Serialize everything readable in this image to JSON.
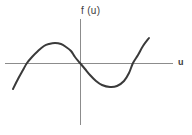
{
  "figure": {
    "title": "",
    "background_color": "#ffffff",
    "axis_color": "#8c8c8c",
    "curve_color": "#3a3a3a"
  },
  "labels": {
    "y_axis": "f (u)",
    "x_axis": "u"
  },
  "chart_data": {
    "type": "line",
    "title": "",
    "xlabel": "u",
    "ylabel": "f (u)",
    "grid": false,
    "legend": null,
    "axes": {
      "x_axis_y_pixel": 63,
      "y_axis_x_pixel": 80,
      "x_axis_range_pixels": [
        5,
        173
      ],
      "y_axis_range_pixels": [
        19,
        125
      ],
      "origin_pixel": [
        80,
        63
      ]
    },
    "annotations": [
      {
        "label": "local maximum",
        "x": 55,
        "y": 43
      },
      {
        "label": "origin crossing",
        "x": 80,
        "y": 63
      },
      {
        "label": "local minimum",
        "x": 110,
        "y": 87
      }
    ],
    "zero_crossings_x_pixels": [
      27,
      80,
      133
    ],
    "x": [
      13,
      18,
      23,
      27,
      32,
      38,
      44,
      49,
      55,
      61,
      66,
      71,
      75,
      80,
      85,
      90,
      96,
      102,
      110,
      117,
      124,
      129,
      133,
      138,
      143,
      149
    ],
    "y": [
      89,
      79,
      70,
      63,
      57,
      51,
      46,
      44,
      43,
      44,
      47,
      51,
      57,
      63,
      69,
      75,
      81,
      85,
      87,
      86,
      81,
      73,
      63,
      55,
      46,
      38
    ],
    "series": [
      {
        "name": "f (u)",
        "points": [
          [
            13,
            89
          ],
          [
            18,
            79
          ],
          [
            23,
            70
          ],
          [
            27,
            63
          ],
          [
            32,
            57
          ],
          [
            38,
            51
          ],
          [
            44,
            46
          ],
          [
            49,
            44
          ],
          [
            55,
            43
          ],
          [
            61,
            44
          ],
          [
            66,
            47
          ],
          [
            71,
            51
          ],
          [
            75,
            57
          ],
          [
            80,
            63
          ],
          [
            85,
            69
          ],
          [
            90,
            75
          ],
          [
            96,
            81
          ],
          [
            102,
            85
          ],
          [
            110,
            87
          ],
          [
            117,
            86
          ],
          [
            124,
            81
          ],
          [
            129,
            73
          ],
          [
            133,
            63
          ],
          [
            138,
            55
          ],
          [
            143,
            46
          ],
          [
            149,
            38
          ]
        ]
      }
    ]
  }
}
